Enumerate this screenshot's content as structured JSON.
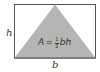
{
  "diagram": {
    "labels": {
      "height": "h",
      "base": "b"
    },
    "formula": {
      "lhs": "A",
      "equals": "=",
      "numerator": "1",
      "denominator": "2",
      "rhs": "bh"
    },
    "colors": {
      "triangle_fill": "#b5b5b5",
      "rectangle_stroke": "#555555",
      "rectangle_fill": "#ffffff",
      "text": "#333333"
    }
  }
}
